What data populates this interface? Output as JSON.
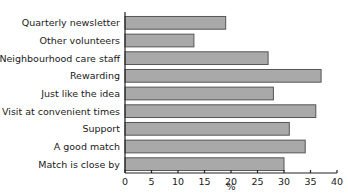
{
  "chart_data": {
    "type": "bar",
    "orientation": "horizontal",
    "title": "",
    "xlabel": "%",
    "ylabel": "",
    "xlim": [
      0,
      40
    ],
    "xticks": [
      0,
      5,
      10,
      15,
      20,
      25,
      30,
      35,
      40
    ],
    "grid": false,
    "legend": null,
    "categories": [
      "Quarterly newsletter",
      "Other volunteers",
      "Neighbourhood care staff",
      "Rewarding",
      "Just like the idea",
      "Visit at convenient times",
      "Support",
      "A good match",
      "Match is close by"
    ],
    "values": [
      19,
      13,
      27,
      37,
      28,
      36,
      31,
      34,
      30
    ],
    "bar_color": "#a9a9a9"
  }
}
